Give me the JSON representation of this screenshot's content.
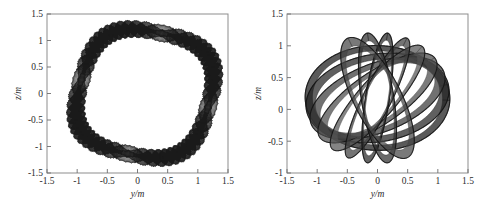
{
  "figure": {
    "background_color": "#ffffff",
    "panel_count": 2
  },
  "chart_data": [
    {
      "type": "line",
      "panel": "left",
      "title": "",
      "xlabel": "y/m",
      "ylabel": "z/m",
      "xlim": [
        -1.5,
        1.5
      ],
      "ylim": [
        -1.5,
        1.5
      ],
      "xticks": [
        -1.5,
        -1,
        -0.5,
        0,
        0.5,
        1,
        1.5
      ],
      "xticklabels": [
        "-1.5",
        "-1",
        "-0.5",
        "0",
        "0.5",
        "1",
        "1.5"
      ],
      "yticks": [
        -1.5,
        -1,
        -0.5,
        0,
        0.5,
        1,
        1.5
      ],
      "yticklabels": [
        "-1.5",
        "-1",
        "-0.5",
        "0",
        "0.5",
        "1",
        "1.5"
      ],
      "grid": false,
      "legend": "none",
      "line_color": "#181818",
      "description": "dense woven quasi-periodic trajectory filling a rounded-square region",
      "envelope": {
        "shape": "superellipse",
        "center": [
          0.12,
          0.0
        ],
        "semi_axis_y": 1.08,
        "semi_axis_z": 1.17,
        "exponent": 3.0,
        "rotation_deg": -14
      },
      "winding": {
        "loops": 150,
        "fast_freq": 46.0,
        "slow_freq": 1.0,
        "stroke_width": 0.35
      }
    },
    {
      "type": "line",
      "panel": "right",
      "title": "",
      "xlabel": "y/m",
      "ylabel": "z/m",
      "xlim": [
        -1.5,
        1.5
      ],
      "ylim": [
        -1.0,
        1.5
      ],
      "xticks": [
        -1.5,
        -1,
        -0.5,
        0,
        0.5,
        1,
        1.5
      ],
      "xticklabels": [
        "-1.5",
        "-1",
        "-0.5",
        "0",
        "0.5",
        "1",
        "1.5"
      ],
      "yticks": [
        -1,
        -0.5,
        0,
        0.5,
        1,
        1.5
      ],
      "yticklabels": [
        "-1",
        "-0.5",
        "0",
        "0.5",
        "1",
        "1.5"
      ],
      "grid": false,
      "legend": "none",
      "line_color": "#181818",
      "description": "about nine thick precessing elliptical bands forming an egg-shaped envelope",
      "envelope": {
        "shape": "oval",
        "center": [
          0.0,
          0.18
        ],
        "semi_axis_y": 1.2,
        "semi_axis_z": 1.03,
        "rotation_deg": -10
      },
      "bands": [
        {
          "tilt_deg": 8,
          "semi_minor": 0.96,
          "thickness": 0.1,
          "shade": "#1a1a1a"
        },
        {
          "tilt_deg": 22,
          "semi_minor": 0.8,
          "thickness": 0.13,
          "shade": "#222222"
        },
        {
          "tilt_deg": 35,
          "semi_minor": 0.62,
          "thickness": 0.15,
          "shade": "#3a3a3a"
        },
        {
          "tilt_deg": 48,
          "semi_minor": 0.46,
          "thickness": 0.16,
          "shade": "#4a4a4a"
        },
        {
          "tilt_deg": 62,
          "semi_minor": 0.33,
          "thickness": 0.15,
          "shade": "#555555"
        },
        {
          "tilt_deg": 76,
          "semi_minor": 0.24,
          "thickness": 0.13,
          "shade": "#3f3f3f"
        },
        {
          "tilt_deg": 92,
          "semi_minor": 0.2,
          "thickness": 0.11,
          "shade": "#2a2a2a"
        },
        {
          "tilt_deg": 108,
          "semi_minor": 0.27,
          "thickness": 0.12,
          "shade": "#303030"
        },
        {
          "tilt_deg": 124,
          "semi_minor": 0.4,
          "thickness": 0.14,
          "shade": "#454545"
        }
      ]
    }
  ]
}
